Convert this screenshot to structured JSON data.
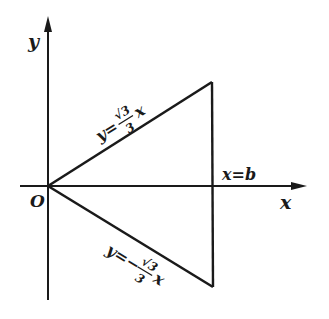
{
  "diagram": {
    "axes": {
      "x_label": "x",
      "y_label": "y",
      "origin_label": "O"
    },
    "lines": {
      "upper": {
        "prefix": "y=",
        "num": "√3",
        "den": "3",
        "suffix": "x"
      },
      "lower": {
        "prefix": "y=−",
        "num": "√3",
        "den": "3",
        "suffix": "x"
      },
      "vertical": {
        "label": "x=b"
      }
    },
    "colors": {
      "ink": "#1a1a1a",
      "background": "#ffffff"
    }
  }
}
